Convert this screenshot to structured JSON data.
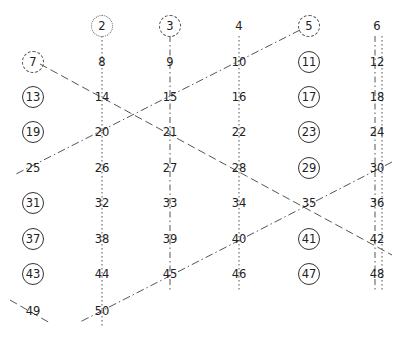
{
  "diagram": {
    "title": "",
    "columns_x": [
      33,
      102,
      170,
      239,
      309,
      377
    ],
    "rows_y": [
      26,
      62,
      97,
      132,
      168,
      203,
      239,
      274,
      311
    ],
    "cells": [
      {
        "n": "2",
        "col": 1,
        "row": 0,
        "style": "dotted-circle"
      },
      {
        "n": "3",
        "col": 2,
        "row": 0,
        "style": "dashed-circle"
      },
      {
        "n": "4",
        "col": 3,
        "row": 0,
        "style": "plain"
      },
      {
        "n": "5",
        "col": 4,
        "row": 0,
        "style": "dashed-circle"
      },
      {
        "n": "6",
        "col": 5,
        "row": 0,
        "style": "plain"
      },
      {
        "n": "7",
        "col": 0,
        "row": 1,
        "style": "dashed-circle"
      },
      {
        "n": "8",
        "col": 1,
        "row": 1,
        "style": "plain"
      },
      {
        "n": "9",
        "col": 2,
        "row": 1,
        "style": "plain"
      },
      {
        "n": "10",
        "col": 3,
        "row": 1,
        "style": "plain"
      },
      {
        "n": "11",
        "col": 4,
        "row": 1,
        "style": "circled"
      },
      {
        "n": "12",
        "col": 5,
        "row": 1,
        "style": "plain"
      },
      {
        "n": "13",
        "col": 0,
        "row": 2,
        "style": "circled"
      },
      {
        "n": "14",
        "col": 1,
        "row": 2,
        "style": "plain"
      },
      {
        "n": "15",
        "col": 2,
        "row": 2,
        "style": "plain"
      },
      {
        "n": "16",
        "col": 3,
        "row": 2,
        "style": "plain"
      },
      {
        "n": "17",
        "col": 4,
        "row": 2,
        "style": "circled"
      },
      {
        "n": "18",
        "col": 5,
        "row": 2,
        "style": "plain"
      },
      {
        "n": "19",
        "col": 0,
        "row": 3,
        "style": "circled"
      },
      {
        "n": "20",
        "col": 1,
        "row": 3,
        "style": "plain"
      },
      {
        "n": "21",
        "col": 2,
        "row": 3,
        "style": "plain"
      },
      {
        "n": "22",
        "col": 3,
        "row": 3,
        "style": "plain"
      },
      {
        "n": "23",
        "col": 4,
        "row": 3,
        "style": "circled"
      },
      {
        "n": "24",
        "col": 5,
        "row": 3,
        "style": "plain"
      },
      {
        "n": "25",
        "col": 0,
        "row": 4,
        "style": "plain"
      },
      {
        "n": "26",
        "col": 1,
        "row": 4,
        "style": "plain"
      },
      {
        "n": "27",
        "col": 2,
        "row": 4,
        "style": "plain"
      },
      {
        "n": "28",
        "col": 3,
        "row": 4,
        "style": "plain"
      },
      {
        "n": "29",
        "col": 4,
        "row": 4,
        "style": "circled"
      },
      {
        "n": "30",
        "col": 5,
        "row": 4,
        "style": "plain"
      },
      {
        "n": "31",
        "col": 0,
        "row": 5,
        "style": "circled"
      },
      {
        "n": "32",
        "col": 1,
        "row": 5,
        "style": "plain"
      },
      {
        "n": "33",
        "col": 2,
        "row": 5,
        "style": "plain"
      },
      {
        "n": "34",
        "col": 3,
        "row": 5,
        "style": "plain"
      },
      {
        "n": "35",
        "col": 4,
        "row": 5,
        "style": "plain"
      },
      {
        "n": "36",
        "col": 5,
        "row": 5,
        "style": "plain"
      },
      {
        "n": "37",
        "col": 0,
        "row": 6,
        "style": "circled"
      },
      {
        "n": "38",
        "col": 1,
        "row": 6,
        "style": "plain"
      },
      {
        "n": "39",
        "col": 2,
        "row": 6,
        "style": "plain"
      },
      {
        "n": "40",
        "col": 3,
        "row": 6,
        "style": "plain"
      },
      {
        "n": "41",
        "col": 4,
        "row": 6,
        "style": "circled"
      },
      {
        "n": "42",
        "col": 5,
        "row": 6,
        "style": "plain"
      },
      {
        "n": "43",
        "col": 0,
        "row": 7,
        "style": "circled"
      },
      {
        "n": "44",
        "col": 1,
        "row": 7,
        "style": "plain"
      },
      {
        "n": "45",
        "col": 2,
        "row": 7,
        "style": "plain"
      },
      {
        "n": "46",
        "col": 3,
        "row": 7,
        "style": "plain"
      },
      {
        "n": "47",
        "col": 4,
        "row": 7,
        "style": "circled"
      },
      {
        "n": "48",
        "col": 5,
        "row": 7,
        "style": "plain"
      },
      {
        "n": "49",
        "col": 0,
        "row": 8,
        "style": "plain"
      },
      {
        "n": "50",
        "col": 1,
        "row": 8,
        "style": "plain"
      }
    ],
    "lines": [
      {
        "name": "multiples-of-2-col2",
        "x1": 102,
        "y1": 36,
        "x2": 102,
        "y2": 326,
        "dash": "1.5,2.5"
      },
      {
        "name": "multiples-of-2-col4",
        "x1": 239,
        "y1": 36,
        "x2": 239,
        "y2": 292,
        "dash": "1.5,2.5"
      },
      {
        "name": "multiples-of-2-col6",
        "x1": 382,
        "y1": 36,
        "x2": 382,
        "y2": 292,
        "dash": "1.5,2.5"
      },
      {
        "name": "multiples-of-3-col3",
        "x1": 170,
        "y1": 36,
        "x2": 170,
        "y2": 292,
        "dash": "6,3,1.5,3"
      },
      {
        "name": "multiples-of-3-col6",
        "x1": 375,
        "y1": 36,
        "x2": 375,
        "y2": 292,
        "dash": "6,3,1.5,3"
      },
      {
        "name": "multiples-of-5-upper",
        "x1": 300,
        "y1": 30,
        "x2": 14,
        "y2": 175,
        "dash": "8,3,1.5,3"
      },
      {
        "name": "multiples-of-5-lower",
        "x1": 392,
        "y1": 162,
        "x2": 80,
        "y2": 322,
        "dash": "8,3,1.5,3"
      },
      {
        "name": "multiples-of-7",
        "x1": 40,
        "y1": 64,
        "x2": 392,
        "y2": 255,
        "dash": "8,4"
      },
      {
        "name": "multiples-of-7-49",
        "x1": 10,
        "y1": 300,
        "x2": 50,
        "y2": 323,
        "dash": "8,4"
      }
    ]
  }
}
